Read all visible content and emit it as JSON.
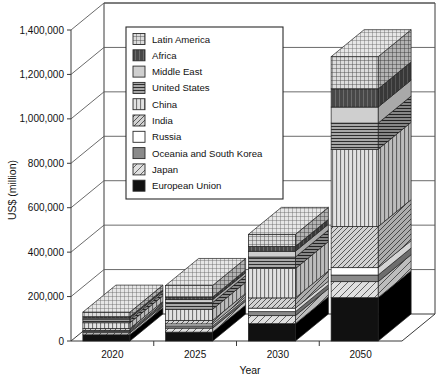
{
  "chart_data": {
    "type": "bar",
    "subtype": "stacked-3d-column",
    "title": "",
    "xlabel": "Year",
    "ylabel": "US$ (million)",
    "categories": [
      "2020",
      "2025",
      "2030",
      "2050"
    ],
    "ylim": [
      0,
      1400000
    ],
    "yticks": [
      0,
      200000,
      400000,
      600000,
      800000,
      1000000,
      1200000,
      1400000
    ],
    "ytick_labels": [
      "0",
      "200,000",
      "400,000",
      "600,000",
      "800,000",
      "1,000,000",
      "1,200,000",
      "1,400,000"
    ],
    "grid": true,
    "legend_position": "upper-left-inside",
    "stack_order_bottom_to_top": [
      "European Union",
      "Japan",
      "Oceania and South Korea",
      "Russia",
      "India",
      "China",
      "United States",
      "Middle East",
      "Africa",
      "Latin America"
    ],
    "series": [
      {
        "name": "European Union",
        "pattern": "solid-black",
        "color": "#111111",
        "values": [
          28000,
          40000,
          78000,
          195000
        ]
      },
      {
        "name": "Japan",
        "pattern": "diagonal-light",
        "color": "#d8d8d8",
        "values": [
          9000,
          18000,
          36000,
          72000
        ]
      },
      {
        "name": "Oceania and South Korea",
        "pattern": "solid-gray",
        "color": "#8a8a8a",
        "values": [
          6000,
          10000,
          18000,
          30000
        ]
      },
      {
        "name": "Russia",
        "pattern": "white",
        "color": "#ffffff",
        "values": [
          5000,
          9000,
          16000,
          33000
        ]
      },
      {
        "name": "India",
        "pattern": "diagonal-dark",
        "color": "#c9c9c9",
        "values": [
          8000,
          16000,
          46000,
          185000
        ]
      },
      {
        "name": "China",
        "pattern": "vertical",
        "color": "#dcdcdc",
        "values": [
          26000,
          50000,
          132000,
          348000
        ]
      },
      {
        "name": "United States",
        "pattern": "horizontal",
        "color": "#9a9a9a",
        "values": [
          14000,
          30000,
          52000,
          118000
        ]
      },
      {
        "name": "Middle East",
        "pattern": "light-gray",
        "color": "#cfcfcf",
        "values": [
          7000,
          13000,
          26000,
          72000
        ]
      },
      {
        "name": "Africa",
        "pattern": "vertical-dark",
        "color": "#6f6f6f",
        "values": [
          6000,
          12000,
          22000,
          82000
        ]
      },
      {
        "name": "Latin America",
        "pattern": "grid-cross",
        "color": "#c4c4c4",
        "values": [
          21000,
          52000,
          54000,
          145000
        ]
      }
    ],
    "totals": [
      130000,
      250000,
      480000,
      1280000
    ]
  },
  "legend": {
    "entries": [
      {
        "label": "Latin America",
        "pattern": "grid-cross"
      },
      {
        "label": "Africa",
        "pattern": "vertical-dark"
      },
      {
        "label": "Middle East",
        "pattern": "light-gray"
      },
      {
        "label": "United States",
        "pattern": "horizontal"
      },
      {
        "label": "China",
        "pattern": "vertical"
      },
      {
        "label": "India",
        "pattern": "diagonal-dark"
      },
      {
        "label": "Russia",
        "pattern": "white"
      },
      {
        "label": "Oceania and South Korea",
        "pattern": "solid-gray"
      },
      {
        "label": "Japan",
        "pattern": "diagonal-light"
      },
      {
        "label": "European Union",
        "pattern": "solid-black"
      }
    ]
  },
  "axes": {
    "y_title": "US$ (million)",
    "x_title": "Year",
    "y_labels": [
      "1,400,000",
      "1,200,000",
      "1,000,000",
      "800,000",
      "600,000",
      "400,000",
      "200,000",
      "0"
    ],
    "x_labels": [
      "2020",
      "2025",
      "2030",
      "2050"
    ]
  }
}
